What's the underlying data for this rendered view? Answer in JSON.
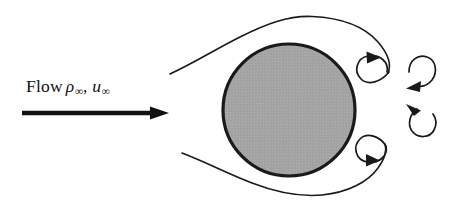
{
  "figure": {
    "background_color": "#ffffff",
    "width": 467,
    "height": 211
  },
  "label": {
    "flow_word": "Flow",
    "density_symbol": "ρ",
    "density_subscript": "∞",
    "separator": ",",
    "velocity_symbol": "u",
    "velocity_subscript": "∞",
    "full_text": "Flow ρ∞, u∞",
    "color": "#111111"
  },
  "arrow": {
    "name": "freestream-flow-arrow",
    "direction": "right",
    "color": "#111111",
    "x_start": 22,
    "x_end": 168,
    "y": 113,
    "shaft_thickness": 4
  },
  "sphere": {
    "name": "sphere-body",
    "center_x": 289,
    "center_y": 110,
    "radius": 66,
    "fill_color": "#a3a3a3",
    "stroke_color": "#1a1a1a",
    "stroke_width": 3.2
  },
  "streamlines": [
    {
      "name": "upper-streamline",
      "position": "top",
      "stroke_color": "#1a1a1a",
      "stroke_width": 1.5
    },
    {
      "name": "lower-streamline",
      "position": "bottom",
      "stroke_color": "#1a1a1a",
      "stroke_width": 1.5
    }
  ],
  "vortices": [
    {
      "name": "wake-vortex-upper-spiral",
      "rotation": "clockwise",
      "stroke_color": "#1a1a1a",
      "stroke_width": 1.6
    },
    {
      "name": "wake-vortex-middle-upper-arc",
      "rotation": "clockwise",
      "stroke_color": "#1a1a1a",
      "stroke_width": 1.6
    },
    {
      "name": "wake-vortex-middle-lower-arc",
      "rotation": "counterclockwise",
      "stroke_color": "#1a1a1a",
      "stroke_width": 1.6
    },
    {
      "name": "wake-vortex-lower-spiral",
      "rotation": "counterclockwise",
      "stroke_color": "#1a1a1a",
      "stroke_width": 1.6
    }
  ]
}
